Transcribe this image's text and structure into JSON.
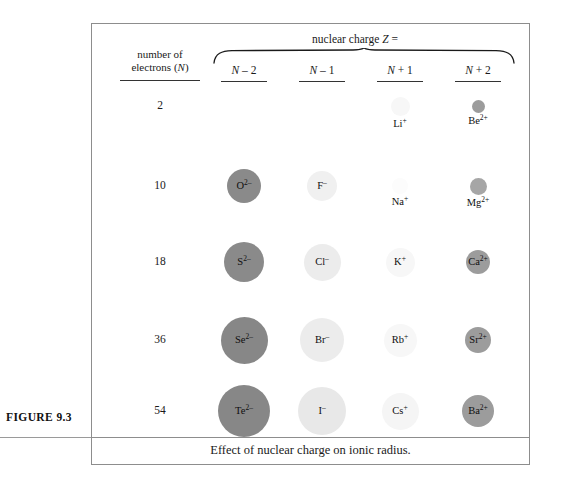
{
  "figure": {
    "label": "FIGURE 9.3",
    "caption": "Effect of nuclear charge on ionic radius."
  },
  "header": {
    "nuclear_charge_title": "nuclear charge Z =",
    "electrons_header_line1": "number of",
    "electrons_header_line2": "electrons (N)",
    "columns": [
      {
        "label": "N – 2",
        "x": 244
      },
      {
        "label": "N – 1",
        "x": 322
      },
      {
        "label": "N + 1",
        "x": 400
      },
      {
        "label": "N + 2",
        "x": 478
      }
    ]
  },
  "rows": [
    {
      "electrons": "2",
      "y": 106,
      "ions": [
        {
          "name": "",
          "charge": "",
          "diameter": 0,
          "color": "#ffffff",
          "label_inside": false,
          "visible": false,
          "x": 244
        },
        {
          "name": "",
          "charge": "",
          "diameter": 0,
          "color": "#ffffff",
          "label_inside": false,
          "visible": false,
          "x": 322
        },
        {
          "name": "Li",
          "charge": "+",
          "diameter": 19,
          "color": "#f7f7f7",
          "label_inside": false,
          "visible": true,
          "x": 400
        },
        {
          "name": "Be",
          "charge": "2+",
          "diameter": 13,
          "color": "#9c9c9c",
          "label_inside": false,
          "visible": true,
          "x": 478
        }
      ]
    },
    {
      "electrons": "10",
      "y": 186,
      "ions": [
        {
          "name": "O",
          "charge": "2–",
          "diameter": 34,
          "color": "#8a8a8a",
          "label_inside": true,
          "visible": true,
          "x": 244
        },
        {
          "name": "F",
          "charge": "–",
          "diameter": 30,
          "color": "#f0f0f0",
          "label_inside": true,
          "visible": true,
          "x": 322
        },
        {
          "name": "Na",
          "charge": "+",
          "diameter": 16,
          "color": "#fcfcfc",
          "label_inside": false,
          "visible": true,
          "x": 400
        },
        {
          "name": "Mg",
          "charge": "2+",
          "diameter": 17,
          "color": "#a6a6a6",
          "label_inside": false,
          "visible": true,
          "x": 478
        }
      ]
    },
    {
      "electrons": "18",
      "y": 262,
      "ions": [
        {
          "name": "S",
          "charge": "2–",
          "diameter": 40,
          "color": "#8a8a8a",
          "label_inside": true,
          "visible": true,
          "x": 244
        },
        {
          "name": "Cl",
          "charge": "–",
          "diameter": 37,
          "color": "#ececec",
          "label_inside": true,
          "visible": true,
          "x": 322
        },
        {
          "name": "K",
          "charge": "+",
          "diameter": 29,
          "color": "#f7f7f7",
          "label_inside": true,
          "visible": true,
          "x": 400
        },
        {
          "name": "Ca",
          "charge": "2+",
          "diameter": 24,
          "color": "#9c9c9c",
          "label_inside": true,
          "visible": true,
          "x": 478
        }
      ]
    },
    {
      "electrons": "36",
      "y": 340,
      "ions": [
        {
          "name": "Se",
          "charge": "2–",
          "diameter": 47,
          "color": "#878787",
          "label_inside": true,
          "visible": true,
          "x": 244
        },
        {
          "name": "Br",
          "charge": "–",
          "diameter": 44,
          "color": "#ececec",
          "label_inside": true,
          "visible": true,
          "x": 322
        },
        {
          "name": "Rb",
          "charge": "+",
          "diameter": 33,
          "color": "#f7f7f7",
          "label_inside": true,
          "visible": true,
          "x": 400
        },
        {
          "name": "Sr",
          "charge": "2+",
          "diameter": 26,
          "color": "#9c9c9c",
          "label_inside": true,
          "visible": true,
          "x": 478
        }
      ]
    },
    {
      "electrons": "54",
      "y": 411,
      "ions": [
        {
          "name": "Te",
          "charge": "2–",
          "diameter": 52,
          "color": "#878787",
          "label_inside": true,
          "visible": true,
          "x": 244
        },
        {
          "name": "I",
          "charge": "–",
          "diameter": 48,
          "color": "#e8e8e8",
          "label_inside": true,
          "visible": true,
          "x": 322
        },
        {
          "name": "Cs",
          "charge": "+",
          "diameter": 37,
          "color": "#f5f5f5",
          "label_inside": true,
          "visible": true,
          "x": 400
        },
        {
          "name": "Ba",
          "charge": "2+",
          "diameter": 32,
          "color": "#9c9c9c",
          "label_inside": true,
          "visible": true,
          "x": 478
        }
      ]
    }
  ],
  "chart_data": {
    "type": "table",
    "title": "Effect of nuclear charge on ionic radius.",
    "xlabel": "nuclear charge Z =",
    "ylabel": "number of electrons (N)",
    "categories": [
      "N – 2",
      "N – 1",
      "N + 1",
      "N + 2"
    ],
    "row_labels": [
      "2",
      "10",
      "18",
      "36",
      "54"
    ],
    "note": "Circle diameter encodes relative ionic radius; shade encodes charge sign (dark = anion, pale = cation).",
    "cells": [
      {
        "row": "2",
        "column": "N – 2",
        "ion": "",
        "diameter_px": 0
      },
      {
        "row": "2",
        "column": "N – 1",
        "ion": "",
        "diameter_px": 0
      },
      {
        "row": "2",
        "column": "N + 1",
        "ion": "Li+",
        "diameter_px": 19
      },
      {
        "row": "2",
        "column": "N + 2",
        "ion": "Be2+",
        "diameter_px": 13
      },
      {
        "row": "10",
        "column": "N – 2",
        "ion": "O2-",
        "diameter_px": 34
      },
      {
        "row": "10",
        "column": "N – 1",
        "ion": "F-",
        "diameter_px": 30
      },
      {
        "row": "10",
        "column": "N + 1",
        "ion": "Na+",
        "diameter_px": 16
      },
      {
        "row": "10",
        "column": "N + 2",
        "ion": "Mg2+",
        "diameter_px": 17
      },
      {
        "row": "18",
        "column": "N – 2",
        "ion": "S2-",
        "diameter_px": 40
      },
      {
        "row": "18",
        "column": "N – 1",
        "ion": "Cl-",
        "diameter_px": 37
      },
      {
        "row": "18",
        "column": "N + 1",
        "ion": "K+",
        "diameter_px": 29
      },
      {
        "row": "18",
        "column": "N + 2",
        "ion": "Ca2+",
        "diameter_px": 24
      },
      {
        "row": "36",
        "column": "N – 2",
        "ion": "Se2-",
        "diameter_px": 47
      },
      {
        "row": "36",
        "column": "N – 1",
        "ion": "Br-",
        "diameter_px": 44
      },
      {
        "row": "36",
        "column": "N + 1",
        "ion": "Rb+",
        "diameter_px": 33
      },
      {
        "row": "36",
        "column": "N + 2",
        "ion": "Sr2+",
        "diameter_px": 26
      },
      {
        "row": "54",
        "column": "N – 2",
        "ion": "Te2-",
        "diameter_px": 52
      },
      {
        "row": "54",
        "column": "N – 1",
        "ion": "I-",
        "diameter_px": 48
      },
      {
        "row": "54",
        "column": "N + 1",
        "ion": "Cs+",
        "diameter_px": 37
      },
      {
        "row": "54",
        "column": "N + 2",
        "ion": "Ba2+",
        "diameter_px": 32
      }
    ]
  }
}
